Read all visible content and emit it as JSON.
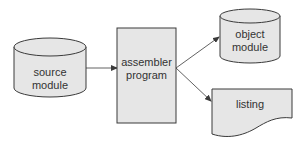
{
  "diagram": {
    "type": "flowchart",
    "nodes": [
      {
        "id": "source",
        "shape": "cylinder",
        "lines": [
          "source",
          "module"
        ]
      },
      {
        "id": "assembler",
        "shape": "rectangle",
        "lines": [
          "assembler",
          "program"
        ]
      },
      {
        "id": "object",
        "shape": "cylinder",
        "lines": [
          "object",
          "module"
        ]
      },
      {
        "id": "listing",
        "shape": "document",
        "lines": [
          "listing"
        ]
      }
    ],
    "edges": [
      {
        "from": "source",
        "to": "assembler"
      },
      {
        "from": "assembler",
        "to": "object"
      },
      {
        "from": "assembler",
        "to": "listing"
      }
    ]
  },
  "colors": {
    "fill": "#e6e6e6",
    "stroke": "#3a3a3a",
    "text": "#333333"
  }
}
